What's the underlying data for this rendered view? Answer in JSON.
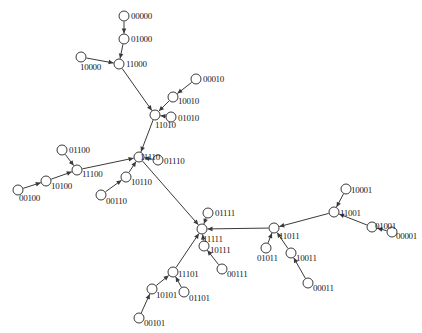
{
  "figure": {
    "title": "",
    "kind": "directed-graph",
    "width": 422,
    "height": 333,
    "background_color": "#ffffff",
    "node_fill_color": "#ffffff",
    "node_stroke_color": "#3a3a3a",
    "edge_color": "#3a3a3a",
    "label_color": "#1a1a1a",
    "node_radius": 5
  },
  "nodes": [
    {
      "id": "00000",
      "label": "00000",
      "cx": 124,
      "cy": 16,
      "lx": 131,
      "ly": 12
    },
    {
      "id": "01000",
      "label": "01000",
      "cx": 124,
      "cy": 39,
      "lx": 131,
      "ly": 35
    },
    {
      "id": "11000",
      "label": "11000",
      "cx": 119,
      "cy": 64,
      "lx": 126,
      "ly": 60
    },
    {
      "id": "10000",
      "label": "10000",
      "cx": 81,
      "cy": 57,
      "lx": 80,
      "ly": 63
    },
    {
      "id": "00010",
      "label": "00010",
      "cx": 196,
      "cy": 79,
      "lx": 203,
      "ly": 75
    },
    {
      "id": "10010",
      "label": "10010",
      "cx": 173,
      "cy": 97,
      "lx": 178,
      "ly": 97
    },
    {
      "id": "01010",
      "label": "01010",
      "cx": 171,
      "cy": 117,
      "lx": 178,
      "ly": 114
    },
    {
      "id": "11010",
      "label": "11010",
      "cx": 155,
      "cy": 115,
      "lx": 155,
      "ly": 121
    },
    {
      "id": "01100",
      "label": "01100",
      "cx": 62,
      "cy": 150,
      "lx": 69,
      "ly": 146
    },
    {
      "id": "11100",
      "label": "11100",
      "cx": 77,
      "cy": 170,
      "lx": 82,
      "ly": 170
    },
    {
      "id": "10100",
      "label": "10100",
      "cx": 46,
      "cy": 181,
      "lx": 51,
      "ly": 182
    },
    {
      "id": "00100",
      "label": "00100",
      "cx": 18,
      "cy": 190,
      "lx": 19,
      "ly": 194
    },
    {
      "id": "11110",
      "label": "11110",
      "cx": 139,
      "cy": 157,
      "lx": 140,
      "ly": 153
    },
    {
      "id": "01110",
      "label": "01110",
      "cx": 158,
      "cy": 160,
      "lx": 164,
      "ly": 157
    },
    {
      "id": "10110",
      "label": "10110",
      "cx": 126,
      "cy": 177,
      "lx": 131,
      "ly": 178
    },
    {
      "id": "00110",
      "label": "00110",
      "cx": 101,
      "cy": 195,
      "lx": 106,
      "ly": 197
    },
    {
      "id": "01111",
      "label": "01111",
      "cx": 208,
      "cy": 213,
      "lx": 215,
      "ly": 209
    },
    {
      "id": "11111",
      "label": "11111",
      "cx": 202,
      "cy": 229,
      "lx": 203,
      "ly": 235
    },
    {
      "id": "10111",
      "label": "10111",
      "cx": 204,
      "cy": 246,
      "lx": 210,
      "ly": 246
    },
    {
      "id": "00111",
      "label": "00111",
      "cx": 222,
      "cy": 269,
      "lx": 227,
      "ly": 270
    },
    {
      "id": "11101",
      "label": "11101",
      "cx": 173,
      "cy": 272,
      "lx": 178,
      "ly": 270
    },
    {
      "id": "10101",
      "label": "10101",
      "cx": 152,
      "cy": 289,
      "lx": 156,
      "ly": 291
    },
    {
      "id": "01101",
      "label": "01101",
      "cx": 184,
      "cy": 292,
      "lx": 189,
      "ly": 294
    },
    {
      "id": "00101",
      "label": "00101",
      "cx": 139,
      "cy": 318,
      "lx": 144,
      "ly": 319
    },
    {
      "id": "11011",
      "label": "11011",
      "cx": 274,
      "cy": 228,
      "lx": 279,
      "ly": 232
    },
    {
      "id": "11001",
      "label": "11001",
      "cx": 334,
      "cy": 212,
      "lx": 340,
      "ly": 209
    },
    {
      "id": "10001",
      "label": "10001",
      "cx": 346,
      "cy": 189,
      "lx": 351,
      "ly": 186
    },
    {
      "id": "01001",
      "label": "01001",
      "cx": 372,
      "cy": 227,
      "lx": 375,
      "ly": 222
    },
    {
      "id": "00001",
      "label": "00001",
      "cx": 392,
      "cy": 232,
      "lx": 396,
      "ly": 232
    },
    {
      "id": "01011",
      "label": "01011",
      "cx": 266,
      "cy": 248,
      "lx": 257,
      "ly": 254
    },
    {
      "id": "10011",
      "label": "10011",
      "cx": 291,
      "cy": 253,
      "lx": 296,
      "ly": 254
    },
    {
      "id": "00011",
      "label": "00011",
      "cx": 308,
      "cy": 283,
      "lx": 313,
      "ly": 284
    }
  ],
  "edges": [
    {
      "from": "00000",
      "to": "01000"
    },
    {
      "from": "01000",
      "to": "11000"
    },
    {
      "from": "10000",
      "to": "11000"
    },
    {
      "from": "11000",
      "to": "11010"
    },
    {
      "from": "00010",
      "to": "10010"
    },
    {
      "from": "10010",
      "to": "11010"
    },
    {
      "from": "01010",
      "to": "11010"
    },
    {
      "from": "11010",
      "to": "11110"
    },
    {
      "from": "01100",
      "to": "11100"
    },
    {
      "from": "00100",
      "to": "10100"
    },
    {
      "from": "10100",
      "to": "11100"
    },
    {
      "from": "11100",
      "to": "11110"
    },
    {
      "from": "01110",
      "to": "11110"
    },
    {
      "from": "00110",
      "to": "10110"
    },
    {
      "from": "10110",
      "to": "11110"
    },
    {
      "from": "11110",
      "to": "11111"
    },
    {
      "from": "01111",
      "to": "11111"
    },
    {
      "from": "10111",
      "to": "11111"
    },
    {
      "from": "00111",
      "to": "10111"
    },
    {
      "from": "11101",
      "to": "11111"
    },
    {
      "from": "10101",
      "to": "11101"
    },
    {
      "from": "01101",
      "to": "11101"
    },
    {
      "from": "00101",
      "to": "10101"
    },
    {
      "from": "11011",
      "to": "11111"
    },
    {
      "from": "11001",
      "to": "11011"
    },
    {
      "from": "10001",
      "to": "11001"
    },
    {
      "from": "01001",
      "to": "11001"
    },
    {
      "from": "00001",
      "to": "01001"
    },
    {
      "from": "01011",
      "to": "11011"
    },
    {
      "from": "10011",
      "to": "11011"
    },
    {
      "from": "00011",
      "to": "10011"
    }
  ]
}
